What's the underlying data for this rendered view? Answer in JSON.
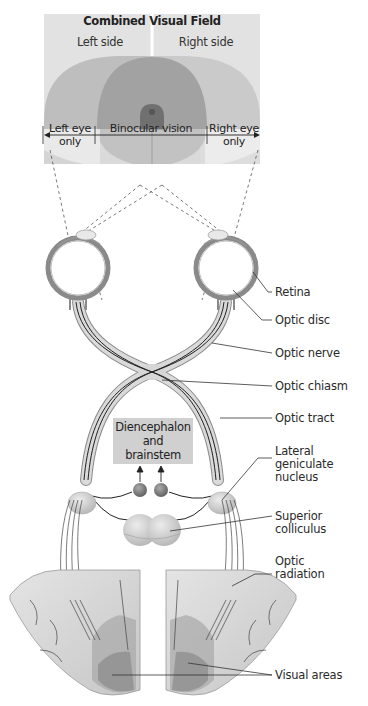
{
  "visual_field": {
    "title": "Combined Visual Field",
    "left_side": "Left side",
    "right_side": "Right side",
    "left_eye_only": [
      "Left eye",
      "only"
    ],
    "binocular": "Binocular vision",
    "right_eye_only": [
      "Right eye",
      "only"
    ]
  },
  "center_box": {
    "lines": [
      "Diencephalon",
      "and",
      "brainstem"
    ]
  },
  "labels": [
    {
      "id": "retina",
      "text": "Retina"
    },
    {
      "id": "optic-disc",
      "text": "Optic disc"
    },
    {
      "id": "optic-nerve",
      "text": "Optic nerve"
    },
    {
      "id": "optic-chiasm",
      "text": "Optic chiasm"
    },
    {
      "id": "optic-tract",
      "text": "Optic tract"
    },
    {
      "id": "lgn",
      "text": "Lateral geniculate nucleus",
      "lines": [
        "Lateral",
        "geniculate",
        "nucleus"
      ]
    },
    {
      "id": "superior-colliculus",
      "text": "Superior colliculus",
      "lines": [
        "Superior",
        "colliculus"
      ]
    },
    {
      "id": "optic-radiation",
      "text": "Optic radiation",
      "lines": [
        "Optic",
        "radiation"
      ]
    },
    {
      "id": "visual-areas",
      "text": "Visual areas"
    }
  ],
  "colors": {
    "field_bg": "#e6e6e6",
    "left_field": "#b9b9b9",
    "right_field": "#c4c4c4",
    "binocular_field": "#9a9a9a",
    "center_spot": "#6e6e6e",
    "nerve_fill": "#d4d4d4",
    "nerve_stroke": "#8a8a8a",
    "brain_fill": "#d9d9d9",
    "box_fill": "#d0d0d0"
  }
}
